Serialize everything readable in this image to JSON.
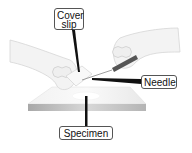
{
  "diagram": {
    "labels": {
      "cover_slip": "Cover slip",
      "cover_line1": "Cover",
      "cover_line2": "slip",
      "needle": "Needle",
      "specimen": "Specimen"
    },
    "colors": {
      "label_border": "#555555",
      "pointer": "#111111",
      "slide_edge": "#b0b0b0",
      "skin": "#f4f4f4"
    }
  }
}
